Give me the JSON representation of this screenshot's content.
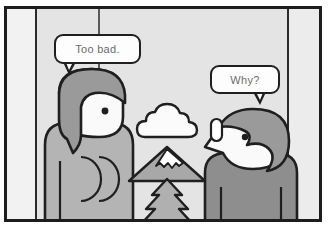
{
  "scene": {
    "title": "Two people talking illustration",
    "width": 330,
    "height": 232
  },
  "colors": {
    "outline": "#1f1f1f",
    "frame_border": "#1d1d1d",
    "wall_left": "#f2f2f2",
    "wall_mid": "#e4e4e4",
    "wall_right": "#ececec",
    "hair": "#9a9a9a",
    "skin": "#fafafa",
    "shirt_left": "#b4b4b4",
    "shirt_right": "#8e8e8e",
    "mountain": "#a8a8a8",
    "snow": "#ffffff",
    "tree": "#b0b0b0",
    "cloud": "#fbfbfb",
    "bubble_fill": "#fdfdfd",
    "bubble_text": "#6c6c6c"
  },
  "bubbles": [
    {
      "id": "left",
      "text": "Too bad.",
      "speaker": "left-person"
    },
    {
      "id": "right",
      "text": "Why?",
      "speaker": "right-person"
    }
  ],
  "characters": [
    {
      "id": "left-person",
      "label": "Person with bob haircut facing right",
      "hair_style": "bob",
      "facing": "right"
    },
    {
      "id": "right-person",
      "label": "Person with short hair facing left",
      "hair_style": "short",
      "facing": "left"
    }
  ],
  "objects": [
    {
      "id": "cloud",
      "label": "Cloud"
    },
    {
      "id": "mountain",
      "label": "Snow-capped mountain"
    },
    {
      "id": "tree",
      "label": "Pine tree"
    }
  ]
}
